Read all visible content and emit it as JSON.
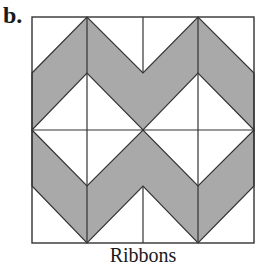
{
  "figure": {
    "panel_label": "b.",
    "caption": "Ribbons",
    "colors": {
      "ribbon_fill": "#a9a9a9",
      "background": "#ffffff",
      "line": "#333333"
    },
    "square": {
      "x0": 32,
      "y0": 17,
      "x1": 254,
      "y1": 243
    },
    "ribbons": [
      {
        "name": "top-ribbon",
        "points": "32,73 87,17 143,73 198,17 254,73 254,130 198,73 143,130 87,73 32,130"
      },
      {
        "name": "bottom-ribbon",
        "points": "32,130 87,186 143,130 198,186 254,130 254,186 198,243 143,186 87,243 32,186"
      }
    ],
    "grid_lines": [
      {
        "name": "center-horizontal-line",
        "x1": 32,
        "y1": 130,
        "x2": 254,
        "y2": 130
      },
      {
        "name": "left-vertical-line",
        "x1": 87,
        "y1": 17,
        "x2": 87,
        "y2": 243
      },
      {
        "name": "right-vertical-line",
        "x1": 198,
        "y1": 17,
        "x2": 198,
        "y2": 243
      },
      {
        "name": "center-top-vertical-line",
        "x1": 143,
        "y1": 17,
        "x2": 143,
        "y2": 73
      },
      {
        "name": "center-bottom-vertical-line",
        "x1": 143,
        "y1": 186,
        "x2": 143,
        "y2": 243
      }
    ]
  }
}
